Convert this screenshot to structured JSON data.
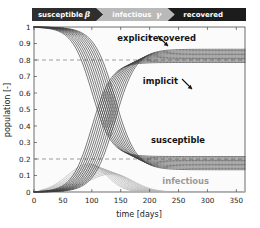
{
  "banner": {
    "stages": [
      {
        "label": "susceptible",
        "symbol": "β",
        "fill": "#2e2e2e",
        "text_color": "#ffffff"
      },
      {
        "label": "infectious",
        "symbol": "γ",
        "fill": "#b9b9b9",
        "text_color": "#ffffff"
      },
      {
        "label": "recovered",
        "symbol": "",
        "fill": "#1c1c1c",
        "text_color": "#ffffff"
      }
    ]
  },
  "annotations": [
    {
      "id": "explicit",
      "text": "explicit",
      "x": 152,
      "y": 41,
      "color": "#141414"
    },
    {
      "id": "recovered",
      "text": "recovered",
      "x": 196,
      "y": 41,
      "color": "#141414"
    },
    {
      "id": "implicit",
      "text": "implicit",
      "x": 178,
      "y": 84,
      "color": "#141414"
    },
    {
      "id": "susceptible",
      "text": "susceptible",
      "x": 205,
      "y": 143,
      "color": "#141414"
    },
    {
      "id": "infectious",
      "text": "infectious",
      "x": 209,
      "y": 184,
      "color": "#9a9a9a"
    }
  ],
  "chart_data": {
    "type": "line",
    "title": "",
    "xlabel": "time [days]",
    "ylabel": "population [-]",
    "xlim": [
      0,
      365
    ],
    "ylim": [
      0,
      1
    ],
    "xticks": [
      0,
      50,
      100,
      150,
      200,
      250,
      300,
      350
    ],
    "xticklabels": [
      "0",
      "50",
      "100",
      "150",
      "200",
      "250",
      "300",
      "350"
    ],
    "yticks": [
      0,
      0.1,
      0.2,
      0.3,
      0.4,
      0.5,
      0.6,
      0.7,
      0.8,
      0.9,
      1
    ],
    "yticklabels": [
      "0",
      "0.1",
      "0.2",
      "0.3",
      "0.4",
      "0.5",
      "0.6",
      "0.7",
      "0.8",
      "0.9",
      "1"
    ],
    "grid": false,
    "legend": "none",
    "reference_lines": [
      {
        "y": 0.8,
        "style": "dashed",
        "color": "#777777"
      },
      {
        "y": 0.2,
        "style": "dashed",
        "color": "#777777"
      }
    ],
    "x_samples": [
      0,
      10,
      20,
      30,
      40,
      50,
      60,
      70,
      80,
      90,
      100,
      110,
      120,
      130,
      140,
      150,
      160,
      170,
      180,
      190,
      200,
      210,
      220,
      230,
      240,
      250,
      260,
      280,
      300,
      320,
      340,
      365
    ],
    "series": [
      {
        "name": "susceptible",
        "group": "susceptible",
        "color": "#3c3c3c",
        "variants": 11,
        "start": 1.0,
        "end_min": 0.135,
        "end_max": 0.215,
        "midpoint_day_min": 100,
        "midpoint_day_max": 140,
        "description": "decaying sigmoid family from 1.0 down to ~0.17"
      },
      {
        "name": "recovered",
        "group": "recovered",
        "color": "#3c3c3c",
        "variants": 11,
        "start": 0.0,
        "end_min": 0.785,
        "end_max": 0.865,
        "midpoint_day_min": 100,
        "midpoint_day_max": 140,
        "description": "rising sigmoid family from 0 up to ~0.82"
      },
      {
        "name": "infectious",
        "group": "infectious",
        "color": "#b0b0b0",
        "variants": 11,
        "start": 0.0,
        "peak_min": 0.11,
        "peak_max": 0.17,
        "peak_day_min": 95,
        "peak_day_max": 135,
        "end": 0.003,
        "description": "bell-shaped epidemic peak family peaking ~0.15 near day 115"
      }
    ]
  }
}
